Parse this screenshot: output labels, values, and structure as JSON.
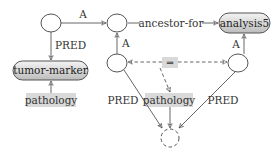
{
  "diagram": {
    "type": "graph-rewrite-rule",
    "nodes": {
      "top_left": {
        "label": ""
      },
      "top_mid": {
        "label": ""
      },
      "analysis5": {
        "label": "analysis5"
      },
      "tumor_marker": {
        "label": "tumor-marker"
      },
      "mid_left": {
        "label": ""
      },
      "right": {
        "label": ""
      },
      "bottom": {
        "label": "",
        "style": "dashed"
      }
    },
    "labels": {
      "pathology_left": "pathology",
      "pathology_center": "pathology",
      "implies": "⇒"
    },
    "edges": {
      "top_left_to_top_mid": "A",
      "top_mid_to_analysis5": "ancestor-for",
      "mid_left_to_top_mid": "A",
      "right_to_analysis5": "A",
      "top_left_to_tumor_marker": "PRED",
      "mid_left_to_bottom": "PRED",
      "right_to_bottom": "PRED"
    },
    "colors": {
      "stroke": "#555555",
      "shade": "#d9d9d9",
      "term_fill_top": "#f2f2f2",
      "term_fill_bottom": "#bdbdbd"
    }
  }
}
